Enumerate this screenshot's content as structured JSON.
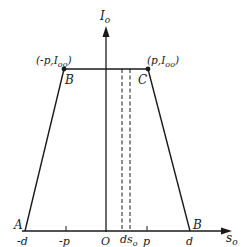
{
  "diagram": {
    "type": "trapezoid-distribution",
    "axes": {
      "y_label": "I",
      "y_label_sub": "o",
      "x_label": "s",
      "x_label_sub": "o"
    },
    "points": {
      "A": "A",
      "B_left": "B",
      "C": "C",
      "B_right": "B"
    },
    "point_labels": {
      "left_top": "(-p,I",
      "left_top_sub": "oo",
      "left_top_close": ")",
      "right_top": "(p,I",
      "right_top_sub": "oo",
      "right_top_close": ")"
    },
    "ticks": {
      "neg_d": "-d",
      "neg_p": "-p",
      "origin": "O",
      "ds": "ds",
      "ds_sub": "o",
      "p": "p",
      "d": "d"
    },
    "colors": {
      "line": "#1a1a1a",
      "background": "#ffffff"
    }
  }
}
